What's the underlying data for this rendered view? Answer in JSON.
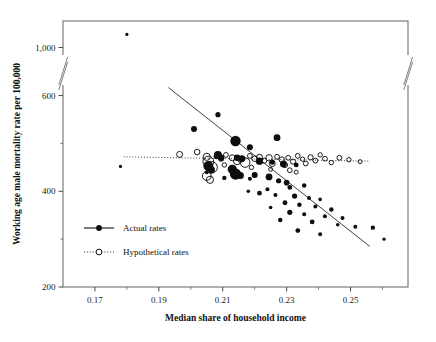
{
  "chart_data": {
    "type": "scatter",
    "title": "",
    "xlabel": "Median share of household income",
    "ylabel": "Working age male mortality rate per 100,000",
    "xlim": [
      0.16,
      0.268
    ],
    "ylim": [
      200,
      1180
    ],
    "grid": false,
    "axis_break": {
      "present": true,
      "between": [
        620,
        980
      ],
      "axes": [
        "y-left",
        "y-right"
      ]
    },
    "xticks": [
      0.17,
      0.19,
      0.21,
      0.23,
      0.25
    ],
    "xtick_labels": [
      "0.17",
      "0.19",
      "0.21",
      "0.23",
      "0.25"
    ],
    "xminor_ticks": [
      0.18,
      0.2,
      0.22,
      0.24,
      0.26
    ],
    "yticks": [
      200,
      400,
      600,
      1000
    ],
    "ytick_labels": [
      "200",
      "400",
      "600",
      "1,000"
    ],
    "yminor_ticks": [
      300,
      500
    ],
    "legend": {
      "position": "inside-lower-left",
      "entries": [
        {
          "name": "Actual rates",
          "marker": "filled-circle",
          "line": "solid",
          "color": "#000000"
        },
        {
          "name": "Hypothetical rates",
          "marker": "open-circle",
          "line": "dotted",
          "color": "#000000"
        }
      ]
    },
    "series": [
      {
        "name": "Actual rates",
        "marker": "filled-circle",
        "points": [
          {
            "x": 0.18,
            "y": 1105,
            "r": 1.6
          },
          {
            "x": 0.201,
            "y": 530,
            "r": 3.0
          },
          {
            "x": 0.2085,
            "y": 560,
            "r": 2.6
          },
          {
            "x": 0.214,
            "y": 505,
            "r": 5.2
          },
          {
            "x": 0.2185,
            "y": 492,
            "r": 3.0
          },
          {
            "x": 0.227,
            "y": 512,
            "r": 3.4
          },
          {
            "x": 0.2085,
            "y": 476,
            "r": 4.0
          },
          {
            "x": 0.2095,
            "y": 470,
            "r": 3.2
          },
          {
            "x": 0.2145,
            "y": 470,
            "r": 3.2
          },
          {
            "x": 0.216,
            "y": 468,
            "r": 3.4
          },
          {
            "x": 0.2215,
            "y": 463,
            "r": 3.6
          },
          {
            "x": 0.2255,
            "y": 461,
            "r": 2.6
          },
          {
            "x": 0.229,
            "y": 457,
            "r": 3.4
          },
          {
            "x": 0.233,
            "y": 455,
            "r": 2.4
          },
          {
            "x": 0.2055,
            "y": 453,
            "r": 5.0
          },
          {
            "x": 0.2065,
            "y": 445,
            "r": 3.4
          },
          {
            "x": 0.213,
            "y": 446,
            "r": 4.6
          },
          {
            "x": 0.214,
            "y": 436,
            "r": 5.6
          },
          {
            "x": 0.2155,
            "y": 433,
            "r": 3.6
          },
          {
            "x": 0.22,
            "y": 434,
            "r": 3.0
          },
          {
            "x": 0.2245,
            "y": 430,
            "r": 3.4
          },
          {
            "x": 0.2105,
            "y": 428,
            "r": 2.2
          },
          {
            "x": 0.2185,
            "y": 426,
            "r": 2.0
          },
          {
            "x": 0.2275,
            "y": 422,
            "r": 2.6
          },
          {
            "x": 0.23,
            "y": 418,
            "r": 2.8
          },
          {
            "x": 0.231,
            "y": 408,
            "r": 2.4
          },
          {
            "x": 0.2355,
            "y": 412,
            "r": 2.2
          },
          {
            "x": 0.224,
            "y": 404,
            "r": 2.0
          },
          {
            "x": 0.218,
            "y": 400,
            "r": 1.8
          },
          {
            "x": 0.2215,
            "y": 396,
            "r": 2.4
          },
          {
            "x": 0.2265,
            "y": 392,
            "r": 2.0
          },
          {
            "x": 0.2325,
            "y": 390,
            "r": 2.6
          },
          {
            "x": 0.237,
            "y": 386,
            "r": 2.0
          },
          {
            "x": 0.2405,
            "y": 383,
            "r": 1.8
          },
          {
            "x": 0.2295,
            "y": 376,
            "r": 2.4
          },
          {
            "x": 0.234,
            "y": 372,
            "r": 2.2
          },
          {
            "x": 0.239,
            "y": 368,
            "r": 2.0
          },
          {
            "x": 0.225,
            "y": 366,
            "r": 1.8
          },
          {
            "x": 0.244,
            "y": 362,
            "r": 2.2
          },
          {
            "x": 0.231,
            "y": 356,
            "r": 2.6
          },
          {
            "x": 0.2355,
            "y": 352,
            "r": 2.0
          },
          {
            "x": 0.242,
            "y": 348,
            "r": 2.0
          },
          {
            "x": 0.2475,
            "y": 344,
            "r": 2.0
          },
          {
            "x": 0.228,
            "y": 340,
            "r": 2.2
          },
          {
            "x": 0.238,
            "y": 336,
            "r": 2.4
          },
          {
            "x": 0.246,
            "y": 330,
            "r": 1.8
          },
          {
            "x": 0.2515,
            "y": 326,
            "r": 2.0
          },
          {
            "x": 0.2335,
            "y": 318,
            "r": 2.4
          },
          {
            "x": 0.2405,
            "y": 310,
            "r": 2.0
          },
          {
            "x": 0.257,
            "y": 324,
            "r": 2.2
          },
          {
            "x": 0.178,
            "y": 452,
            "r": 1.6
          },
          {
            "x": 0.205,
            "y": 440,
            "r": 2.0
          },
          {
            "x": 0.2605,
            "y": 300,
            "r": 1.6
          }
        ]
      },
      {
        "name": "Hypothetical rates",
        "marker": "open-circle",
        "points": [
          {
            "x": 0.1965,
            "y": 477,
            "r": 3.0
          },
          {
            "x": 0.202,
            "y": 482,
            "r": 2.8
          },
          {
            "x": 0.205,
            "y": 472,
            "r": 3.6
          },
          {
            "x": 0.2055,
            "y": 462,
            "r": 5.4
          },
          {
            "x": 0.2065,
            "y": 450,
            "r": 5.8
          },
          {
            "x": 0.208,
            "y": 473,
            "r": 2.4
          },
          {
            "x": 0.2095,
            "y": 468,
            "r": 2.6
          },
          {
            "x": 0.211,
            "y": 476,
            "r": 2.4
          },
          {
            "x": 0.213,
            "y": 470,
            "r": 3.0
          },
          {
            "x": 0.2145,
            "y": 463,
            "r": 3.6
          },
          {
            "x": 0.2155,
            "y": 466,
            "r": 2.6
          },
          {
            "x": 0.217,
            "y": 460,
            "r": 4.8
          },
          {
            "x": 0.2185,
            "y": 474,
            "r": 2.4
          },
          {
            "x": 0.22,
            "y": 468,
            "r": 2.8
          },
          {
            "x": 0.2215,
            "y": 471,
            "r": 3.0
          },
          {
            "x": 0.223,
            "y": 464,
            "r": 2.6
          },
          {
            "x": 0.2245,
            "y": 470,
            "r": 3.2
          },
          {
            "x": 0.2255,
            "y": 458,
            "r": 3.0
          },
          {
            "x": 0.227,
            "y": 472,
            "r": 2.4
          },
          {
            "x": 0.2285,
            "y": 466,
            "r": 2.8
          },
          {
            "x": 0.2295,
            "y": 455,
            "r": 2.6
          },
          {
            "x": 0.2305,
            "y": 470,
            "r": 2.4
          },
          {
            "x": 0.232,
            "y": 462,
            "r": 2.6
          },
          {
            "x": 0.2335,
            "y": 474,
            "r": 2.4
          },
          {
            "x": 0.235,
            "y": 467,
            "r": 2.2
          },
          {
            "x": 0.236,
            "y": 458,
            "r": 2.4
          },
          {
            "x": 0.2375,
            "y": 471,
            "r": 2.6
          },
          {
            "x": 0.239,
            "y": 464,
            "r": 2.4
          },
          {
            "x": 0.2405,
            "y": 476,
            "r": 2.2
          },
          {
            "x": 0.242,
            "y": 468,
            "r": 2.4
          },
          {
            "x": 0.244,
            "y": 460,
            "r": 2.2
          },
          {
            "x": 0.2465,
            "y": 470,
            "r": 2.4
          },
          {
            "x": 0.2495,
            "y": 466,
            "r": 2.2
          },
          {
            "x": 0.253,
            "y": 462,
            "r": 2.0
          },
          {
            "x": 0.2105,
            "y": 455,
            "r": 2.2
          },
          {
            "x": 0.2125,
            "y": 448,
            "r": 2.0
          },
          {
            "x": 0.219,
            "y": 450,
            "r": 2.2
          },
          {
            "x": 0.225,
            "y": 446,
            "r": 2.0
          },
          {
            "x": 0.231,
            "y": 444,
            "r": 2.4
          },
          {
            "x": 0.233,
            "y": 440,
            "r": 2.0
          },
          {
            "x": 0.205,
            "y": 432,
            "r": 4.4
          },
          {
            "x": 0.206,
            "y": 424,
            "r": 3.6
          }
        ]
      }
    ],
    "trend_lines": [
      {
        "name": "Actual rates trend",
        "style": "solid",
        "x0": 0.193,
        "y0": 680,
        "x1": 0.256,
        "y1": 285
      },
      {
        "name": "Hypothetical rates trend",
        "style": "dotted",
        "x0": 0.179,
        "y0": 472,
        "x1": 0.256,
        "y1": 463
      }
    ]
  }
}
